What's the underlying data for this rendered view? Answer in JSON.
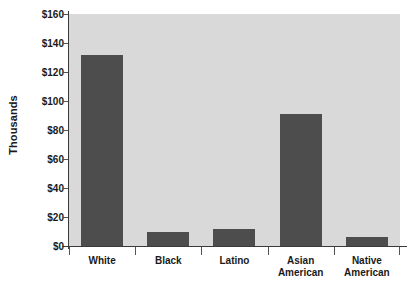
{
  "chart_data": {
    "type": "bar",
    "title": "",
    "xlabel": "",
    "ylabel": "Thousands",
    "categories": [
      "White",
      "Black",
      "Latino",
      "Asian American",
      "Native American"
    ],
    "values": [
      132,
      10,
      12,
      91,
      6
    ],
    "ylim": [
      0,
      160
    ],
    "ytick_values": [
      0,
      20,
      40,
      60,
      80,
      100,
      120,
      140,
      160
    ],
    "ytick_labels": [
      "$0",
      "$20",
      "$40",
      "$60",
      "$80",
      "$100",
      "$120",
      "$140",
      "$160"
    ],
    "grid": false,
    "legend": null,
    "series": [
      {
        "name": "",
        "values": [
          132,
          10,
          12,
          91,
          6
        ]
      }
    ]
  },
  "axes": {
    "y_title": "Thousands"
  },
  "colors": {
    "bar_fill": "#4d4d4d",
    "plot_background": "#d9d9d9",
    "page_background": "#ffffff",
    "axis_line": "#3a3a3a",
    "text": "#1a1a1a"
  }
}
